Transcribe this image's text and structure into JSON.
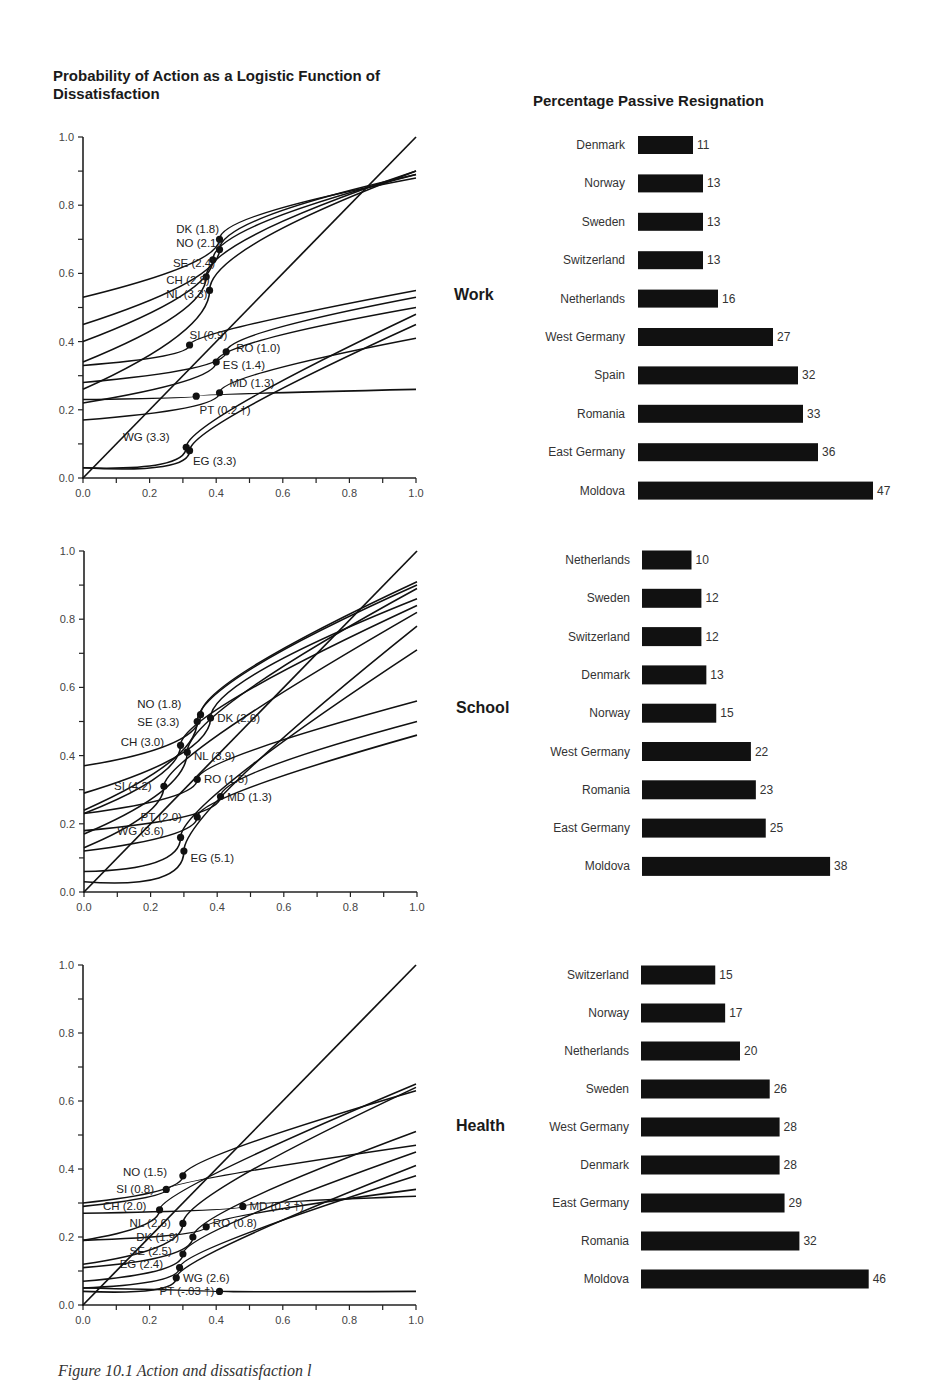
{
  "left_title": "Probability of Action as a Logistic Function of Dissatisfaction",
  "right_title": "Percentage Passive Resignation",
  "caption": "Figure 10.1 Action and dissatisfaction l",
  "chart_data": [
    {
      "type": "line",
      "panel": "Work",
      "title": "Probability of Action as a Logistic Function of Dissatisfaction",
      "xlabel": "",
      "ylabel": "",
      "xlim": [
        0,
        1
      ],
      "ylim": [
        0,
        1
      ],
      "xticks": [
        "0.0",
        "0.2",
        "0.4",
        "0.6",
        "0.8",
        "1.0"
      ],
      "yticks": [
        "0.0",
        "0.2",
        "0.4",
        "0.6",
        "0.8",
        "1.0"
      ],
      "grid": false,
      "series": [
        {
          "name": "DK (1.8)",
          "marker": [
            0.41,
            0.7
          ],
          "y_at_0": 0.53,
          "y_at_1": 0.88,
          "label_pos": [
            0.28,
            0.73
          ]
        },
        {
          "name": "NO (2.1)",
          "marker": [
            0.41,
            0.67
          ],
          "y_at_0": 0.45,
          "y_at_1": 0.89,
          "label_pos": [
            0.28,
            0.69
          ]
        },
        {
          "name": "SE (2.4)",
          "marker": [
            0.39,
            0.64
          ],
          "y_at_0": 0.4,
          "y_at_1": 0.89,
          "label_pos": [
            0.27,
            0.63
          ]
        },
        {
          "name": "CH (2.8)",
          "marker": [
            0.37,
            0.59
          ],
          "y_at_0": 0.34,
          "y_at_1": 0.9,
          "label_pos": [
            0.25,
            0.58
          ]
        },
        {
          "name": "NL (3.3)",
          "marker": [
            0.38,
            0.55
          ],
          "y_at_0": 0.26,
          "y_at_1": 0.9,
          "label_pos": [
            0.25,
            0.54
          ]
        },
        {
          "name": "SI (0.9)",
          "marker": [
            0.32,
            0.39
          ],
          "y_at_0": 0.33,
          "y_at_1": 0.55,
          "label_pos": [
            0.32,
            0.42
          ]
        },
        {
          "name": "RO (1.0)",
          "marker": [
            0.43,
            0.37
          ],
          "y_at_0": 0.28,
          "y_at_1": 0.53,
          "label_pos": [
            0.46,
            0.38
          ]
        },
        {
          "name": "ES (1.4)",
          "marker": [
            0.4,
            0.34
          ],
          "y_at_0": 0.22,
          "y_at_1": 0.5,
          "label_pos": [
            0.42,
            0.33
          ]
        },
        {
          "name": "MD (1.3)",
          "marker": [
            0.41,
            0.25
          ],
          "y_at_0": 0.17,
          "y_at_1": 0.41,
          "label_pos": [
            0.44,
            0.28
          ]
        },
        {
          "name": "PT (0.2 †)",
          "marker": [
            0.34,
            0.24
          ],
          "y_at_0": 0.23,
          "y_at_1": 0.26,
          "label_pos": [
            0.35,
            0.2
          ]
        },
        {
          "name": "WG (3.3)",
          "marker": [
            0.31,
            0.09
          ],
          "y_at_0": 0.03,
          "y_at_1": 0.48,
          "label_pos": [
            0.12,
            0.12
          ]
        },
        {
          "name": "EG (3.3)",
          "marker": [
            0.32,
            0.08
          ],
          "y_at_0": 0.03,
          "y_at_1": 0.45,
          "label_pos": [
            0.33,
            0.05
          ]
        },
        {
          "name": "diagonal",
          "y_at_0": 0.0,
          "y_at_1": 1.0
        }
      ]
    },
    {
      "type": "bar",
      "panel": "Work",
      "title": "Percentage Passive Resignation",
      "categories": [
        "Denmark",
        "Norway",
        "Sweden",
        "Switzerland",
        "Netherlands",
        "West Germany",
        "Spain",
        "Romania",
        "East Germany",
        "Moldova"
      ],
      "values": [
        11,
        13,
        13,
        13,
        16,
        27,
        32,
        33,
        36,
        47
      ]
    },
    {
      "type": "line",
      "panel": "School",
      "xlim": [
        0,
        1
      ],
      "ylim": [
        0,
        1
      ],
      "xticks": [
        "0.0",
        "0.2",
        "0.4",
        "0.6",
        "0.8",
        "1.0"
      ],
      "yticks": [
        "0.0",
        "0.2",
        "0.4",
        "0.6",
        "0.8",
        "1.0"
      ],
      "grid": false,
      "series": [
        {
          "name": "NO (1.8)",
          "marker": [
            0.35,
            0.52
          ],
          "y_at_0": 0.37,
          "y_at_1": 0.91,
          "label_pos": [
            0.16,
            0.55
          ]
        },
        {
          "name": "SE (3.3)",
          "marker": [
            0.34,
            0.5
          ],
          "y_at_0": 0.24,
          "y_at_1": 0.9,
          "label_pos": [
            0.16,
            0.5
          ]
        },
        {
          "name": "DK (2.6)",
          "marker": [
            0.38,
            0.51
          ],
          "y_at_0": 0.29,
          "y_at_1": 0.86,
          "label_pos": [
            0.4,
            0.51
          ]
        },
        {
          "name": "CH (3.0)",
          "marker": [
            0.29,
            0.43
          ],
          "y_at_0": 0.23,
          "y_at_1": 0.84,
          "label_pos": [
            0.11,
            0.44
          ]
        },
        {
          "name": "NL (3.9)",
          "marker": [
            0.31,
            0.41
          ],
          "y_at_0": 0.17,
          "y_at_1": 0.89,
          "label_pos": [
            0.33,
            0.4
          ]
        },
        {
          "name": "SI (4.2)",
          "marker": [
            0.24,
            0.31
          ],
          "y_at_0": 0.13,
          "y_at_1": 0.82,
          "label_pos": [
            0.09,
            0.31
          ]
        },
        {
          "name": "RO (1.5)",
          "marker": [
            0.34,
            0.33
          ],
          "y_at_0": 0.23,
          "y_at_1": 0.56,
          "label_pos": [
            0.36,
            0.33
          ]
        },
        {
          "name": "MD (1.3)",
          "marker": [
            0.41,
            0.28
          ],
          "y_at_0": 0.18,
          "y_at_1": 0.5,
          "label_pos": [
            0.43,
            0.28
          ]
        },
        {
          "name": "PT (2.0)",
          "marker": [
            0.34,
            0.22
          ],
          "y_at_0": 0.12,
          "y_at_1": 0.46,
          "label_pos": [
            0.17,
            0.22
          ]
        },
        {
          "name": "WG (3.6)",
          "marker": [
            0.29,
            0.16
          ],
          "y_at_0": 0.06,
          "y_at_1": 0.71,
          "label_pos": [
            0.1,
            0.18
          ]
        },
        {
          "name": "EG (5.1)",
          "marker": [
            0.3,
            0.12
          ],
          "y_at_0": 0.03,
          "y_at_1": 0.78,
          "label_pos": [
            0.32,
            0.1
          ]
        },
        {
          "name": "diagonal",
          "y_at_0": 0.0,
          "y_at_1": 1.0
        }
      ]
    },
    {
      "type": "bar",
      "panel": "School",
      "categories": [
        "Netherlands",
        "Sweden",
        "Switzerland",
        "Denmark",
        "Norway",
        "West Germany",
        "Romania",
        "East Germany",
        "Moldova"
      ],
      "values": [
        10,
        12,
        12,
        13,
        15,
        22,
        23,
        25,
        38
      ]
    },
    {
      "type": "line",
      "panel": "Health",
      "xlim": [
        0,
        1
      ],
      "ylim": [
        0,
        1
      ],
      "xticks": [
        "0.0",
        "0.2",
        "0.4",
        "0.6",
        "0.8",
        "1.0"
      ],
      "yticks": [
        "0.0",
        "0.2",
        "0.4",
        "0.6",
        "0.8",
        "1.0"
      ],
      "grid": false,
      "series": [
        {
          "name": "NO (1.5)",
          "marker": [
            0.3,
            0.38
          ],
          "y_at_0": 0.3,
          "y_at_1": 0.63,
          "label_pos": [
            0.12,
            0.39
          ]
        },
        {
          "name": "SI (0.8)",
          "marker": [
            0.25,
            0.34
          ],
          "y_at_0": 0.29,
          "y_at_1": 0.47,
          "label_pos": [
            0.1,
            0.34
          ]
        },
        {
          "name": "CH (2.0)",
          "marker": [
            0.23,
            0.28
          ],
          "y_at_0": 0.19,
          "y_at_1": 0.65,
          "label_pos": [
            0.06,
            0.29
          ]
        },
        {
          "name": "MD (0.3 †)",
          "marker": [
            0.48,
            0.29
          ],
          "y_at_0": 0.27,
          "y_at_1": 0.32,
          "label_pos": [
            0.5,
            0.29
          ]
        },
        {
          "name": "NL (2.6)",
          "marker": [
            0.3,
            0.24
          ],
          "y_at_0": 0.12,
          "y_at_1": 0.64,
          "label_pos": [
            0.14,
            0.24
          ]
        },
        {
          "name": "RO (0.8)",
          "marker": [
            0.37,
            0.23
          ],
          "y_at_0": 0.19,
          "y_at_1": 0.34,
          "label_pos": [
            0.39,
            0.24
          ]
        },
        {
          "name": "DK (1.9)",
          "marker": [
            0.33,
            0.2
          ],
          "y_at_0": 0.11,
          "y_at_1": 0.51,
          "label_pos": [
            0.16,
            0.2
          ]
        },
        {
          "name": "SE (2.5)",
          "marker": [
            0.3,
            0.15
          ],
          "y_at_0": 0.07,
          "y_at_1": 0.45,
          "label_pos": [
            0.14,
            0.16
          ]
        },
        {
          "name": "EG (2.4)",
          "marker": [
            0.29,
            0.11
          ],
          "y_at_0": 0.05,
          "y_at_1": 0.38,
          "label_pos": [
            0.11,
            0.12
          ]
        },
        {
          "name": "WG (2.6)",
          "marker": [
            0.28,
            0.08
          ],
          "y_at_0": 0.04,
          "y_at_1": 0.41,
          "label_pos": [
            0.3,
            0.08
          ]
        },
        {
          "name": "PT (-.03 †)",
          "marker": [
            0.41,
            0.04
          ],
          "y_at_0": 0.05,
          "y_at_1": 0.04,
          "label_pos": [
            0.23,
            0.04
          ]
        },
        {
          "name": "diagonal",
          "y_at_0": 0.0,
          "y_at_1": 1.0
        }
      ]
    },
    {
      "type": "bar",
      "panel": "Health",
      "categories": [
        "Switzerland",
        "Norway",
        "Netherlands",
        "Sweden",
        "West Germany",
        "Denmark",
        "East Germany",
        "Romania",
        "Moldova"
      ],
      "values": [
        15,
        17,
        20,
        26,
        28,
        28,
        29,
        32,
        46
      ]
    }
  ],
  "panels": [
    {
      "section_label": "Work"
    },
    {
      "section_label": "School"
    },
    {
      "section_label": "Health"
    }
  ]
}
